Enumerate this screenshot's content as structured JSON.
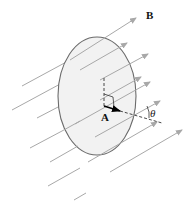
{
  "diagram": {
    "labels": {
      "field_label": "B",
      "area_vector_label": "A",
      "angle_label": "θ"
    },
    "colors": {
      "surface_fill": "#f2f2f2",
      "surface_stroke": "#6b6b6b",
      "field_lines": "#a8a8a8",
      "area_vector": "#000000",
      "dashed_lines": "#333333"
    },
    "surface": {
      "shape": "ellipse",
      "cx": 97,
      "cy": 96,
      "rx": 39,
      "ry": 59
    },
    "field_lines_count": 12,
    "field_direction": "up-right, parallel arrows"
  }
}
